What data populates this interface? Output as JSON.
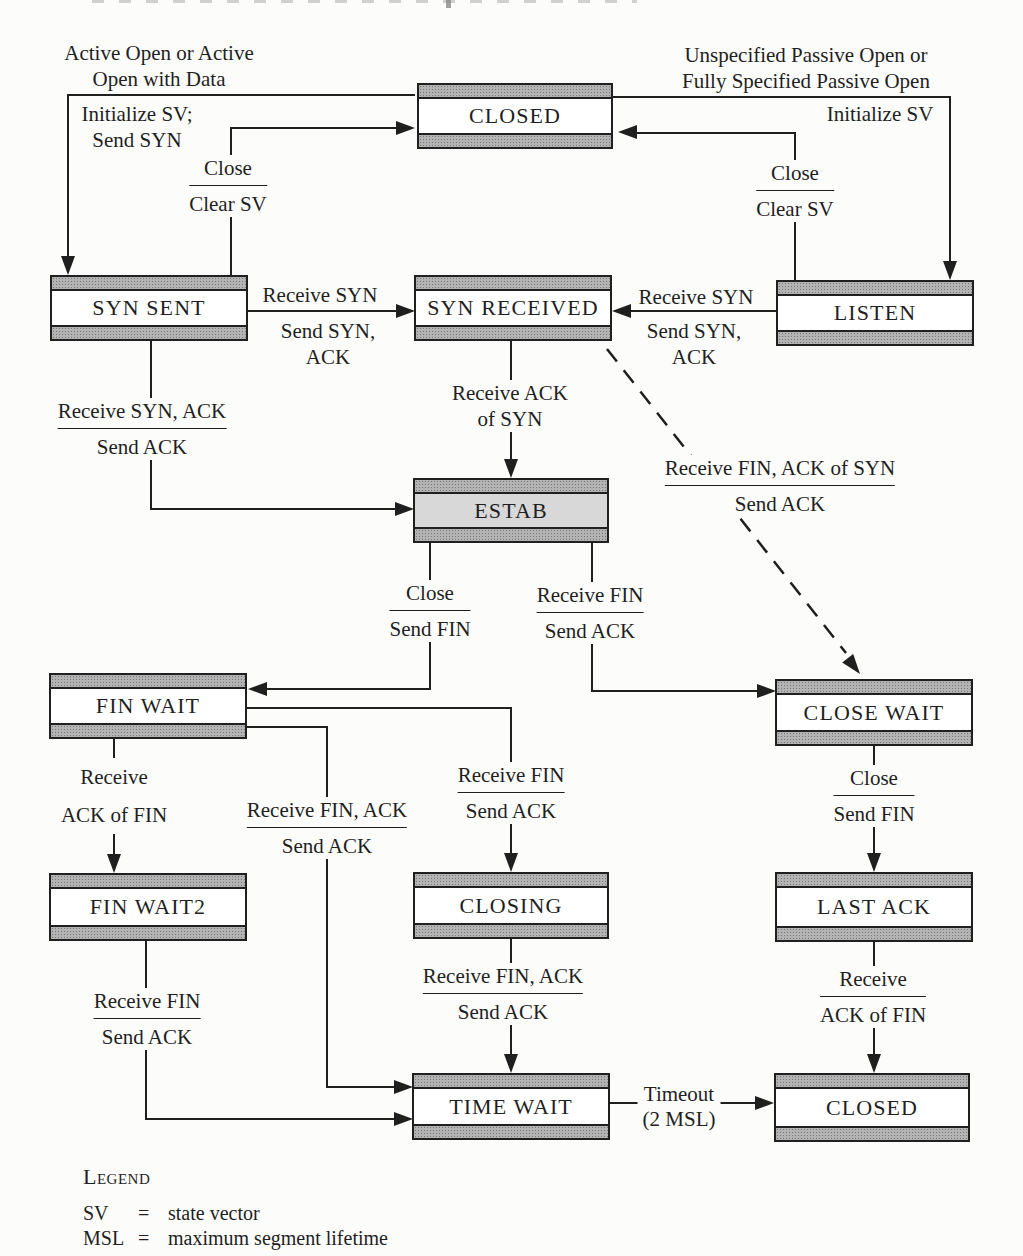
{
  "diagram_title": "TCP connection state diagram",
  "states": {
    "closed_top": "CLOSED",
    "syn_sent": "SYN SENT",
    "syn_received": "SYN RECEIVED",
    "listen": "LISTEN",
    "estab": "ESTAB",
    "fin_wait": "FIN WAIT",
    "close_wait": "CLOSE WAIT",
    "fin_wait2": "FIN WAIT2",
    "closing": "CLOSING",
    "last_ack": "LAST ACK",
    "time_wait": "TIME WAIT",
    "closed_bottom": "CLOSED"
  },
  "labels": {
    "active_open": {
      "line1": "Active Open or Active",
      "line2": "Open with Data"
    },
    "init_sv_left": {
      "line1": "Initialize SV;",
      "line2": "Send SYN"
    },
    "close_clear_left": {
      "top": "Close",
      "bottom": "Clear SV"
    },
    "passive_open": {
      "line1": "Unspecified Passive Open or",
      "line2": "Fully Specified Passive Open"
    },
    "init_sv_right": {
      "line1": "Initialize SV"
    },
    "close_clear_right": {
      "top": "Close",
      "bottom": "Clear SV"
    },
    "recv_syn_left": {
      "above": "Receive SYN",
      "below1": "Send SYN,",
      "below2": "ACK"
    },
    "recv_syn_right": {
      "above": "Receive SYN",
      "below1": "Send SYN,",
      "below2": "ACK"
    },
    "recv_ack_of_syn": {
      "line1": "Receive ACK",
      "line2": "of SYN"
    },
    "recv_syn_ack_send_ack": {
      "top": "Receive SYN, ACK",
      "bottom": "Send ACK"
    },
    "recv_fin_ack_of_syn": {
      "top": "Receive FIN, ACK of SYN",
      "bottom": "Send ACK"
    },
    "close_send_fin_left": {
      "top": "Close",
      "bottom": "Send FIN"
    },
    "recv_fin_estab": {
      "top": "Receive FIN",
      "bottom": "Send ACK"
    },
    "recv_ack_of_fin_finwait": {
      "line1": "Receive",
      "line2": "ACK of FIN"
    },
    "recv_fin_ack_finwait": {
      "top": "Receive FIN, ACK",
      "bottom": "Send ACK"
    },
    "recv_fin_to_closing": {
      "top": "Receive FIN",
      "bottom": "Send ACK"
    },
    "close_send_fin_right": {
      "top": "Close",
      "bottom": "Send FIN"
    },
    "recv_fin_finwait2": {
      "top": "Receive FIN",
      "bottom": "Send ACK"
    },
    "recv_fin_ack_closing": {
      "top": "Receive FIN, ACK",
      "bottom": "Send ACK"
    },
    "recv_ack_of_fin_lastack": {
      "top": "Receive",
      "bottom": "ACK of FIN"
    },
    "timeout": {
      "line1": "Timeout",
      "line2": "(2 MSL)"
    }
  },
  "legend": {
    "title": "Legend",
    "eq": "=",
    "rows": [
      {
        "term": "SV",
        "def": "state vector"
      },
      {
        "term": "MSL",
        "def": "maximum segment lifetime"
      }
    ]
  },
  "colors": {
    "paper": "#fcfcfa",
    "ink": "#1f1f1f",
    "band": "#b3b3b3",
    "band_dot": "#777777",
    "estab_fill": "#d8d8d8"
  }
}
